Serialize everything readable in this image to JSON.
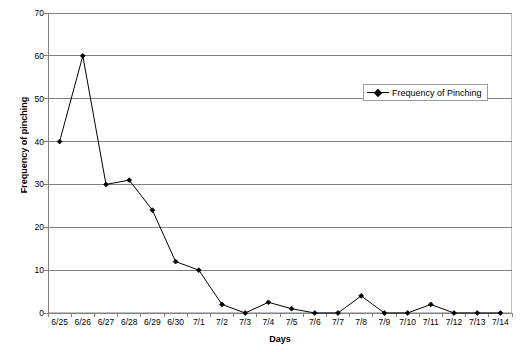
{
  "chart_data": {
    "type": "line",
    "title": "",
    "xlabel": "Days",
    "ylabel": "Frequency of pinching",
    "ylim": [
      0,
      70
    ],
    "yticks": [
      0,
      10,
      20,
      30,
      40,
      50,
      60,
      70
    ],
    "grid": true,
    "legend_position": "top-right",
    "categories": [
      "6/25",
      "6/26",
      "6/27",
      "6/28",
      "6/29",
      "6/30",
      "7/1",
      "7/2",
      "7/3",
      "7/4",
      "7/5",
      "7/6",
      "7/7",
      "7/8",
      "7/9",
      "7/10",
      "7/11",
      "7/12",
      "7/13",
      "7/14"
    ],
    "series": [
      {
        "name": "Frequency of Pinching",
        "color": "#000000",
        "marker": "diamond",
        "values": [
          40,
          60,
          30,
          31,
          24,
          12,
          10,
          2,
          0,
          2.5,
          1,
          0,
          0,
          4,
          0,
          0,
          2,
          0,
          0,
          0
        ]
      }
    ]
  },
  "legend": {
    "entries": [
      {
        "label": "Frequency of Pinching"
      }
    ]
  }
}
